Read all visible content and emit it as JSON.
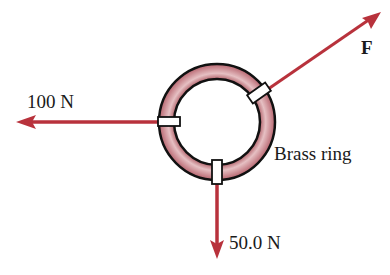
{
  "diagram": {
    "object_label": "Brass ring",
    "forces": [
      {
        "id": "left",
        "label": "100 N",
        "direction": "left"
      },
      {
        "id": "down",
        "label": "50.0 N",
        "direction": "down"
      },
      {
        "id": "f",
        "label": "F",
        "direction": "up-right"
      }
    ],
    "colors": {
      "arrow": "#b8323c",
      "ring_fill": "#d9a3a8",
      "ring_outline": "#111111",
      "clip_fill": "#ffffff"
    }
  }
}
